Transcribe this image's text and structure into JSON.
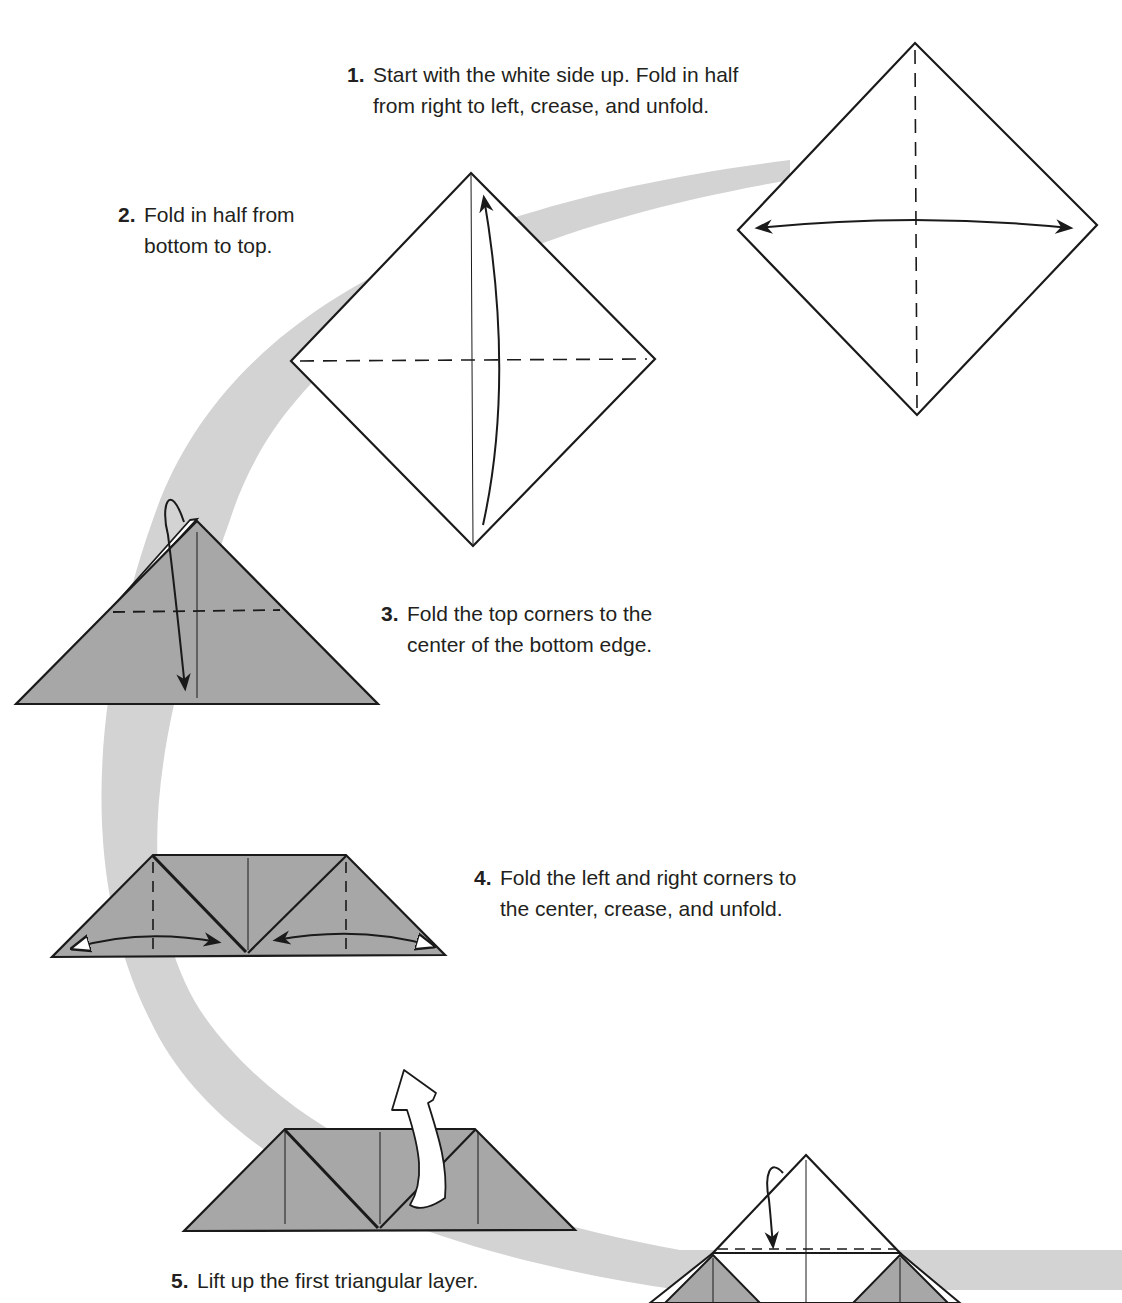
{
  "document": {
    "type": "origami-instructions",
    "colors": {
      "background": "#ffffff",
      "path_band": "#d3d3d3",
      "paper_colored_side": "#a7a7a7",
      "paper_white_side": "#ffffff",
      "line": "#1a1a1a",
      "text": "#231f20"
    },
    "steps": [
      {
        "number": "1.",
        "line1": "Start with the white side up. Fold in half",
        "line2": "from right to left, crease, and unfold."
      },
      {
        "number": "2.",
        "line1": "Fold in half from",
        "line2": "bottom to top."
      },
      {
        "number": "3.",
        "line1": "Fold the top corners to the",
        "line2": "center of the bottom edge."
      },
      {
        "number": "4.",
        "line1": "Fold the left and right corners to",
        "line2": "the center, crease, and unfold."
      },
      {
        "number": "5.",
        "line1": "Lift up the first triangular layer.",
        "line2": ""
      }
    ],
    "diagrams": [
      {
        "id": "step-1",
        "shape": "white square (diamond)",
        "crease": "vertical dashed valley fold",
        "arrow": "double-headed horizontal arrow"
      },
      {
        "id": "step-2",
        "shape": "white square (diamond) with vertical crease",
        "crease": "horizontal dashed valley fold",
        "arrow": "curved arrow bottom to top"
      },
      {
        "id": "step-3",
        "shape": "gray triangle (layered)",
        "crease": "horizontal dashed fold",
        "arrow": "looped arrow to bottom center"
      },
      {
        "id": "step-4",
        "shape": "gray trapezoid",
        "crease": "two vertical dashed folds",
        "arrow": "two fold-and-unfold arrows to center"
      },
      {
        "id": "step-5",
        "shape": "gray trapezoid",
        "crease": "none",
        "arrow": "hollow lift-up arrow"
      },
      {
        "id": "step-6-partial",
        "shape": "white/gray model",
        "crease": "horizontal dashed fold",
        "arrow": "looped arrow down"
      }
    ]
  }
}
